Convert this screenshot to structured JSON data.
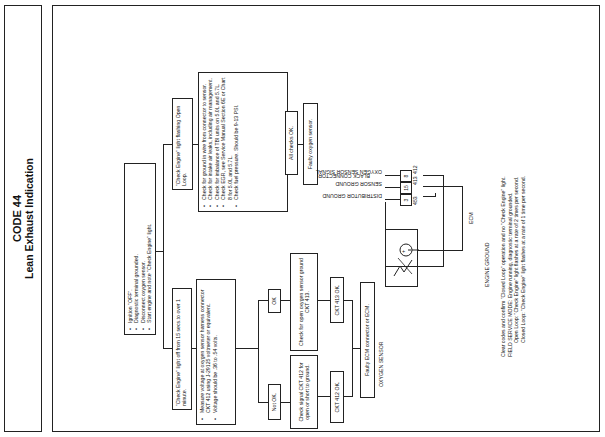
{
  "title": {
    "code": "CODE 44",
    "subtitle": "Lean Exhaust Indication"
  },
  "flowchart": {
    "start_steps": [
      "Ignition \"OFF\".",
      "Diagnostic terminal grounded.",
      "Disconnect oxygen sensor.",
      "Start engine and note \"Check Engine\" light."
    ],
    "branch_left": {
      "label": "\"Check Engine\" light off from 15 secs.to over 1 minute.",
      "measure_steps": [
        "Measure voltage at oxygen sensor harness connector CKT 412 using J-29125 voltmeter or equivalent.",
        "Voltage should be .36 to .54 volts."
      ],
      "ok_label": "OK",
      "not_ok_label": "Not OK.",
      "ok_action": "Check for open oxygen sensor ground CKT 413.",
      "not_ok_action": "Check signal CKT 412 for open or short to ground.",
      "ok_result": "CKT 413 OK.",
      "not_ok_result": "CKT 412 OK.",
      "final": "Faulty ECM connector or ECM."
    },
    "branch_right": {
      "label": "\"Check Engine\" light flashing Open Loop.",
      "checks": [
        "Check for ground in wire from connector to sensor.",
        "Check for intake air leaks, including air management.",
        "Check for imbalance of TBI units on 5.0L and 5.7L.",
        "Check EGR, see Service Manual Section 6E or Chart 8 for 5.0L and 5.7L.",
        "Check fuel pressure. Should be 9-13 PSI."
      ],
      "all_ok": "All checks OK.",
      "final": "Faulty oxygen sensor."
    }
  },
  "wiring": {
    "connector_label": "BLACK CONNECTOR",
    "pins": [
      {
        "pin": "8",
        "wire": "412",
        "signal": "OXYGEN SENSOR SIGNAL"
      },
      {
        "pin": "15",
        "wire": "413",
        "signal": "SENSOR GROUND"
      },
      {
        "pin": "3",
        "wire": "453",
        "signal": "DISTRIBUTOR GROUND"
      }
    ],
    "ecm_label": "ECM",
    "sensor_label": "OXYGEN SENSOR",
    "ground_label": "ENGINE GROUND"
  },
  "notes": {
    "line1": "Clear codes and confirm \"Closed Loop\" operation and no \"Check Engine\" light.",
    "line2": "FIELD SERVICE MODE:  Engine running, diagnostic terminal grounded.",
    "line3": "Open Loop:  \"Check Engine\" light flashes at a rate of 2 times per second.",
    "line4": "Closed Loop:  \"Check Engine\" light flashes at a rate of 1 time per second."
  }
}
